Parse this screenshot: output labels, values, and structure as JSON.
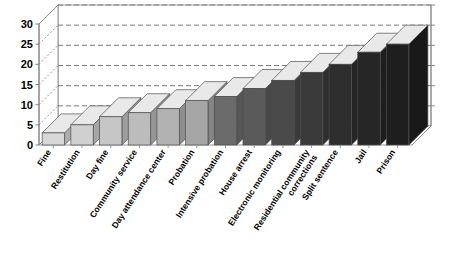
{
  "chart_data": {
    "type": "bar",
    "title": "",
    "subtitle": "",
    "xlabel": "",
    "ylabel": "",
    "ylim": [
      0,
      30
    ],
    "ytick_values": [
      0,
      5,
      10,
      15,
      20,
      25,
      30
    ],
    "ytick_labels": [
      "0",
      "5",
      "10",
      "15",
      "20",
      "25",
      "30"
    ],
    "grid": true,
    "grid_style": "dashed-horizontal",
    "legend": "none",
    "style": "3d-bar",
    "categories": [
      "Fine",
      "Restitution",
      "Day fine",
      "Community service",
      "Day attendance center",
      "Probation",
      "Intensive probation",
      "House arrest",
      "Electronic monitoring",
      "Residential community corrections",
      "Split sentence",
      "Jail",
      "Prison"
    ],
    "values": [
      3,
      5,
      7,
      8,
      9,
      11,
      12,
      14,
      16,
      18,
      20,
      23,
      25
    ],
    "bar_colors": [
      "#d8d8d8",
      "#d0d0d0",
      "#c6c6c6",
      "#bcbcbc",
      "#b2b2b2",
      "#a6a6a6",
      "#6b6b6b",
      "#5a5a5a",
      "#4a4a4a",
      "#3a3a3a",
      "#2e2e2e",
      "#262626",
      "#1e1e1e"
    ],
    "axis_color": "#8a8a8a",
    "gridline_color": "#7a7a7a",
    "text_color": "#000000",
    "background_color": "#ffffff"
  }
}
